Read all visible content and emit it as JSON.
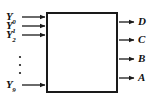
{
  "figure": {
    "type": "block-diagram",
    "block": {
      "label": "",
      "x": 46,
      "y": 12,
      "width": 72,
      "height": 81,
      "border_color": "#1a1a1a",
      "fill_color": "#ffffff",
      "border_width": 2
    },
    "inputs": [
      {
        "name": "Y0",
        "base": "Y",
        "sub": "0",
        "y": 17
      },
      {
        "name": "Y1",
        "base": "Y",
        "sub": "1",
        "y": 26
      },
      {
        "name": "Y2",
        "base": "Y",
        "sub": "2",
        "y": 35
      },
      {
        "name": "Y9",
        "base": "Y",
        "sub": "9",
        "y": 85
      }
    ],
    "input_ellipsis": {
      "glyph": "vertical-dots",
      "count": 3,
      "x": 20,
      "y_start": 57,
      "y_step": 8
    },
    "outputs": [
      {
        "name": "D",
        "y": 22
      },
      {
        "name": "C",
        "y": 40
      },
      {
        "name": "B",
        "y": 59
      },
      {
        "name": "A",
        "y": 78
      }
    ],
    "line_color": "#1a1a1a",
    "background": "#ffffff"
  }
}
